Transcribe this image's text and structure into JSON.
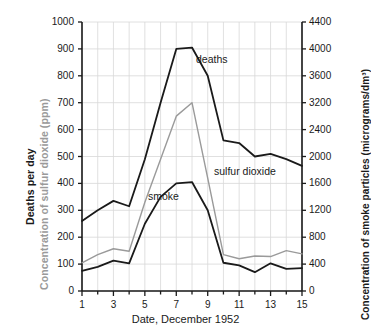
{
  "chart_data": {
    "type": "line",
    "title": "",
    "xlabel": "Date, December 1952",
    "x": [
      1,
      2,
      3,
      4,
      5,
      6,
      7,
      8,
      9,
      10,
      11,
      12,
      13,
      14,
      15
    ],
    "x_ticks": [
      "1",
      "3",
      "5",
      "7",
      "9",
      "11",
      "13",
      "15"
    ],
    "xlim": [
      1,
      15
    ],
    "grid": true,
    "legend": "inline-annotations",
    "axes": {
      "left": {
        "title_primary": "Deaths per day",
        "title_secondary": "Concentration of sulfur dioxide (ppm)",
        "ticks": [
          "1000",
          "900",
          "800",
          "700",
          "600",
          "500",
          "400",
          "300",
          "200",
          "100",
          "0"
        ],
        "lim": [
          0,
          1000
        ]
      },
      "right": {
        "title": "Concentration of smoke particles (micrograms/dm³)",
        "ticks": [
          "4400",
          "4000",
          "3600",
          "3200",
          "2400",
          "2000",
          "1600",
          "1200",
          "800",
          "400",
          "0"
        ],
        "lim": [
          0,
          4400
        ]
      }
    },
    "series": [
      {
        "name": "deaths",
        "label": "deaths",
        "color": "#1a1a1a",
        "axis": "left",
        "unit": "deaths per day",
        "values": [
          260,
          300,
          335,
          315,
          490,
          700,
          900,
          905,
          800,
          560,
          550,
          500,
          510,
          490,
          465
        ]
      },
      {
        "name": "sulfur dioxide",
        "label": "sulfur dioxide",
        "color": "#9a9a9a",
        "axis": "left",
        "unit": "ppm",
        "values": [
          105,
          135,
          157,
          148,
          330,
          490,
          650,
          700,
          420,
          135,
          120,
          130,
          128,
          150,
          138
        ]
      },
      {
        "name": "smoke",
        "label": "smoke",
        "color": "#1a1a1a",
        "axis": "right",
        "unit": "micrograms/dm³",
        "values_left_scale": [
          75,
          90,
          113,
          103,
          250,
          350,
          400,
          405,
          300,
          105,
          95,
          70,
          103,
          82,
          85
        ],
        "values": [
          330,
          396,
          497,
          453,
          1100,
          1540,
          1760,
          1782,
          1320,
          462,
          418,
          308,
          453,
          361,
          374
        ]
      }
    ]
  }
}
